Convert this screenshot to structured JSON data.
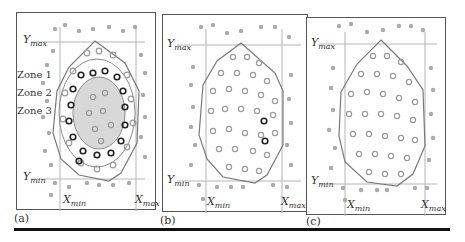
{
  "figure": {
    "panels": [
      {
        "caption": "(a)",
        "axis_labels": {
          "ymax": "Y",
          "ymax_sub": "max",
          "ymin": "Y",
          "ymin_sub": "min",
          "xmin": "X",
          "xmin_sub": "min",
          "xmax": "X",
          "xmax_sub": "max"
        },
        "zones": [
          "Zone 1",
          "Zone 2",
          "Zone 3"
        ],
        "description": "Convex hull around points with three concentric zones; zone 2 ring of highlighted dark circles, zone 3 shaded center"
      },
      {
        "caption": "(b)",
        "axis_labels": {
          "ymax": "Y",
          "ymax_sub": "max",
          "ymin": "Y",
          "ymin_sub": "min",
          "xmin": "X",
          "xmin_sub": "min",
          "xmax": "X",
          "xmax_sub": "max"
        },
        "description": "Convex hull with two highlighted dark circles inside"
      },
      {
        "caption": "(c)",
        "axis_labels": {
          "ymax": "Y",
          "ymax_sub": "max",
          "ymin": "Y",
          "ymin_sub": "min",
          "xmin": "X",
          "xmin_sub": "min",
          "xmax": "X",
          "xmax_sub": "max"
        },
        "description": "Convex hull with points inside, none highlighted"
      }
    ],
    "colors": {
      "frame": "#555555",
      "grid_line": "#b0b0b0",
      "hull": "#777777",
      "dot": "#a8a8a8",
      "ring": "#9a9a9a",
      "highlight_ring": "#222222",
      "zone3_fill": "#d8d8d8"
    }
  }
}
